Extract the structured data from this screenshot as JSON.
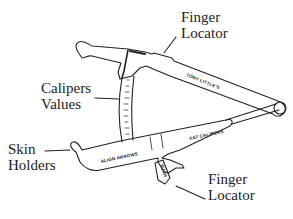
{
  "diagram": {
    "stroke_color": "#222222",
    "background": "#ffffff",
    "labels": {
      "finger_locator_top": {
        "line1": "Finger",
        "line2": "Locator"
      },
      "calipers_values": {
        "line1": "Calipers",
        "line2": "Values"
      },
      "skin_holders": {
        "line1": "Skin",
        "line2": "Holders"
      },
      "finger_locator_bottom": {
        "line1": "Finger",
        "line2": "Locator"
      }
    },
    "device_text": {
      "upper_arm": "TONY LITTLE'S",
      "lower_arm": "FAT CALIPERS",
      "align": "ALIGN ARROWS",
      "push": "PUSH"
    }
  }
}
